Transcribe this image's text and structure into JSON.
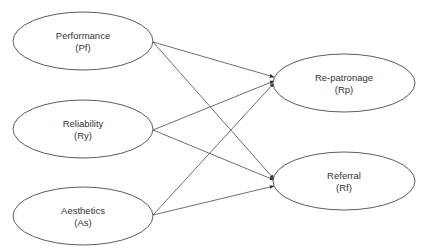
{
  "diagram": {
    "type": "path-model",
    "colors": {
      "stroke": "#4a4a4a",
      "text": "#333333",
      "background": "#ffffff"
    },
    "nodes": [
      {
        "id": "Pf",
        "label": "Performance",
        "abbr": "(Pf)",
        "role": "predictor",
        "cx": 83,
        "cy": 41,
        "rx": 70,
        "ry": 29
      },
      {
        "id": "Ry",
        "label": "Reliability",
        "abbr": "(Ry)",
        "role": "predictor",
        "cx": 83,
        "cy": 129,
        "rx": 70,
        "ry": 29
      },
      {
        "id": "As",
        "label": "Aesthetics",
        "abbr": "(As)",
        "role": "predictor",
        "cx": 83,
        "cy": 216,
        "rx": 70,
        "ry": 29
      },
      {
        "id": "Rp",
        "label": "Re-patronage",
        "abbr": "(Rp)",
        "role": "outcome",
        "cx": 344,
        "cy": 83,
        "rx": 71,
        "ry": 29
      },
      {
        "id": "Rf",
        "label": "Referral",
        "abbr": "(Rf)",
        "role": "outcome",
        "cx": 344,
        "cy": 181,
        "rx": 71,
        "ry": 29
      }
    ],
    "edges": [
      {
        "from": "Pf",
        "to": "Rp",
        "x1": 153,
        "y1": 42,
        "x2": 274,
        "y2": 77
      },
      {
        "from": "Pf",
        "to": "Rf",
        "x1": 153,
        "y1": 42,
        "x2": 274,
        "y2": 179
      },
      {
        "from": "Ry",
        "to": "Rp",
        "x1": 153,
        "y1": 130,
        "x2": 274,
        "y2": 81
      },
      {
        "from": "Ry",
        "to": "Rf",
        "x1": 153,
        "y1": 130,
        "x2": 274,
        "y2": 180
      },
      {
        "from": "As",
        "to": "Rp",
        "x1": 153,
        "y1": 215,
        "x2": 274,
        "y2": 83
      },
      {
        "from": "As",
        "to": "Rf",
        "x1": 153,
        "y1": 215,
        "x2": 274,
        "y2": 186
      }
    ]
  }
}
